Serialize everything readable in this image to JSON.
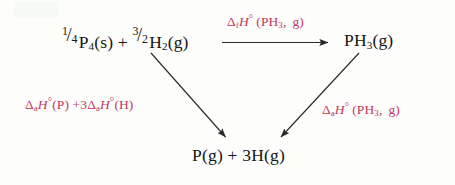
{
  "diagram": {
    "type": "thermochemical-cycle",
    "accent_color": "#c03a5e",
    "text_color": "#161616",
    "background_color": "#fdfdfc"
  },
  "nodes": {
    "reactants": {
      "name": "reactants-expression",
      "frac1": {
        "numerator": "1",
        "solidus": "/",
        "denominator": "4"
      },
      "term1_formula": "P",
      "term1_sub": "4",
      "term1_state": "(s)",
      "plus": "+",
      "frac2": {
        "numerator": "3",
        "solidus": "/",
        "denominator": "2"
      },
      "term2_formula": "H",
      "term2_sub": "2",
      "term2_state": "(g)",
      "plain_text": "1/4 P4(s) + 3/2 H2(g)"
    },
    "product_top_right": {
      "name": "phosphine-gas",
      "formula": "PH",
      "sub": "3",
      "state": "(g)",
      "plain_text": "PH3(g)"
    },
    "product_bottom": {
      "name": "atoms-expression",
      "term1_formula": "P",
      "term1_state": "(g)",
      "plus": "+",
      "coefficient": "3",
      "term2_formula": "H",
      "term2_state": "(g)",
      "plain_text": "P(g) + 3H(g)"
    }
  },
  "labels": {
    "formation": {
      "name": "formation-enthalpy-label",
      "delta": "Δ",
      "subscript": "f",
      "symbol": "H",
      "degree": "°",
      "open_paren": "(",
      "species": "PH",
      "species_sub": "3",
      "comma": ",",
      "state": "g",
      "close_paren": ")",
      "plain_text": "ΔfH°(PH3, g)"
    },
    "atomization_left": {
      "name": "atomization-enthalpy-left-label",
      "delta1": "Δ",
      "sub1": "a",
      "symbol1": "H",
      "degree1": "°",
      "species1": "(P)",
      "plus": "+",
      "coefficient": "3",
      "delta2": "Δ",
      "sub2": "a",
      "symbol2": "H",
      "degree2": "°",
      "species2": "(H)",
      "plain_text": "ΔaH°(P) + 3ΔaH°(H)"
    },
    "atomization_right": {
      "name": "atomization-enthalpy-right-label",
      "delta": "Δ",
      "subscript": "a",
      "symbol": "H",
      "degree": "°",
      "open_paren": "(",
      "species": "PH",
      "species_sub": "3",
      "comma": ",",
      "state": "g",
      "close_paren": ")",
      "plain_text": "ΔaH°(PH3, g)"
    }
  },
  "arrows": [
    {
      "name": "arrow-formation-horizontal",
      "from": "reactants",
      "to": "product_top_right",
      "direction": "right",
      "label": "formation"
    },
    {
      "name": "arrow-atomization-left-diagonal",
      "from": "reactants",
      "to": "product_bottom",
      "direction": "down-right",
      "label": "atomization_left"
    },
    {
      "name": "arrow-atomization-right-diagonal",
      "from": "product_top_right",
      "to": "product_bottom",
      "direction": "down-left",
      "label": "atomization_right"
    }
  ]
}
